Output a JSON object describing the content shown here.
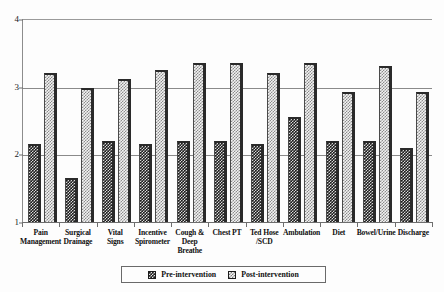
{
  "chart_data": {
    "type": "bar",
    "title": "",
    "subtitle": "",
    "xlabel": "",
    "ylabel": "",
    "ylim": [
      1,
      4
    ],
    "yticks": [
      1,
      2,
      3,
      4
    ],
    "ytick_labels": [
      "1",
      "2",
      "3",
      "4"
    ],
    "grid": true,
    "legend_position": "bottom-center",
    "categories": [
      "Pain Management",
      "Surgical Drainage",
      "Vital Signs",
      "Incentive Spirometer",
      "Cough & Deep Breathe",
      "Chest PT",
      "Ted Hose /SCD",
      "Ambulation",
      "Diet",
      "Bowel/Urine",
      "Discharge"
    ],
    "category_lines": [
      [
        "Pain",
        "Management"
      ],
      [
        "Surgical",
        "Drainage"
      ],
      [
        "Vital",
        "Signs"
      ],
      [
        "Incentive",
        "Spirometer"
      ],
      [
        "Cough &",
        "Deep",
        "Breathe"
      ],
      [
        "Chest PT"
      ],
      [
        "Ted Hose",
        "/SCD"
      ],
      [
        "Ambulation"
      ],
      [
        "Diet"
      ],
      [
        "Bowel/Urine"
      ],
      [
        "Discharge"
      ]
    ],
    "series": [
      {
        "name": "Pre-intervention",
        "values": [
          2.15,
          1.65,
          2.2,
          2.15,
          2.2,
          2.2,
          2.15,
          2.55,
          2.2,
          2.2,
          2.1
        ]
      },
      {
        "name": "Post-intervention",
        "values": [
          3.2,
          2.98,
          3.12,
          3.25,
          3.35,
          3.35,
          3.2,
          3.35,
          2.92,
          3.3,
          2.92
        ]
      }
    ]
  },
  "legend": {
    "items": [
      {
        "label": "Pre-intervention",
        "swatch": "pre-intervention-swatch"
      },
      {
        "label": "Post-intervention",
        "swatch": "post-intervention-swatch"
      }
    ]
  }
}
